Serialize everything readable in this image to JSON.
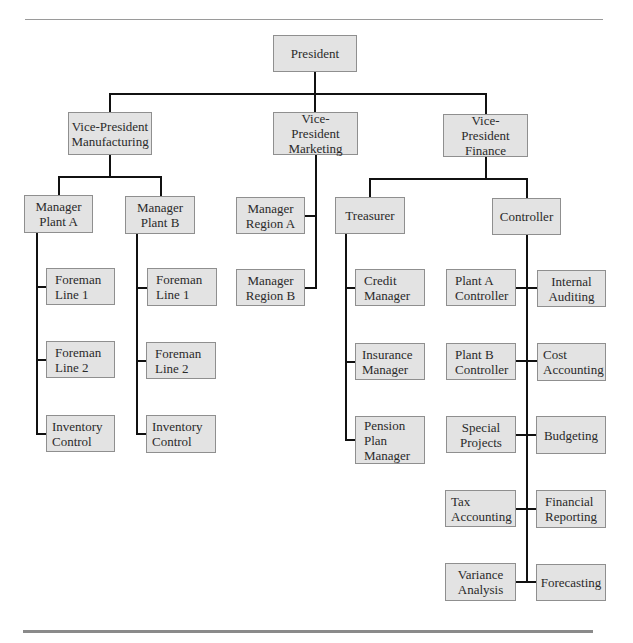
{
  "chart": {
    "type": "organization-chart",
    "root": {
      "label": "President",
      "children": [
        {
          "label": "Vice-President\nManufacturing",
          "children": [
            {
              "label": "Manager\nPlant A",
              "children": [
                {
                  "label": "Foreman\nLine 1"
                },
                {
                  "label": "Foreman\nLine 2"
                },
                {
                  "label": "Inventory\nControl"
                }
              ]
            },
            {
              "label": "Manager\nPlant B",
              "children": [
                {
                  "label": "Foreman\nLine 1"
                },
                {
                  "label": "Foreman\nLine 2"
                },
                {
                  "label": "Inventory\nControl"
                }
              ]
            }
          ]
        },
        {
          "label": "Vice-President\nMarketing",
          "children": [
            {
              "label": "Manager\nRegion A"
            },
            {
              "label": "Manager\nRegion B"
            }
          ]
        },
        {
          "label": "Vice-President\nFinance",
          "children": [
            {
              "label": "Treasurer",
              "children": [
                {
                  "label": "Credit\nManager"
                },
                {
                  "label": "Insurance\nManager"
                },
                {
                  "label": "Pension\nPlan\nManager"
                }
              ]
            },
            {
              "label": "Controller",
              "children": [
                {
                  "label": "Plant A\nController"
                },
                {
                  "label": "Internal\nAuditing"
                },
                {
                  "label": "Plant B\nController"
                },
                {
                  "label": "Cost\nAccounting"
                },
                {
                  "label": "Special\nProjects"
                },
                {
                  "label": "Budgeting"
                },
                {
                  "label": "Tax\nAccounting"
                },
                {
                  "label": "Financial\nReporting"
                },
                {
                  "label": "Variance\nAnalysis"
                },
                {
                  "label": "Forecasting"
                }
              ]
            }
          ]
        }
      ]
    }
  },
  "nodes": {
    "president": "President",
    "vp_manufacturing": "Vice-President\nManufacturing",
    "vp_marketing": "Vice-President\nMarketing",
    "vp_finance": "Vice-President\nFinance",
    "manager_plant_a": "Manager\nPlant A",
    "manager_plant_b": "Manager\nPlant B",
    "plant_a_foreman_line_1": "Foreman\nLine 1",
    "plant_a_foreman_line_2": "Foreman\nLine 2",
    "plant_a_inventory_control": "Inventory\nControl",
    "plant_b_foreman_line_1": "Foreman\nLine 1",
    "plant_b_foreman_line_2": "Foreman\nLine 2",
    "plant_b_inventory_control": "Inventory\nControl",
    "manager_region_a": "Manager\nRegion A",
    "manager_region_b": "Manager\nRegion B",
    "treasurer": "Treasurer",
    "controller": "Controller",
    "credit_manager": "Credit\nManager",
    "insurance_manager": "Insurance\nManager",
    "pension_plan_manager": "Pension\nPlan\nManager",
    "plant_a_controller": "Plant A\nController",
    "internal_auditing": "Internal\nAuditing",
    "plant_b_controller": "Plant B\nController",
    "cost_accounting": "Cost\nAccounting",
    "special_projects": "Special\nProjects",
    "budgeting": "Budgeting",
    "tax_accounting": "Tax\nAccounting",
    "financial_reporting": "Financial\nReporting",
    "variance_analysis": "Variance\nAnalysis",
    "forecasting": "Forecasting"
  },
  "colors": {
    "box_fill": "#e3e3e3",
    "box_border": "#8f8f8f",
    "connector": "#111111",
    "rule": "#9a9a9a"
  }
}
